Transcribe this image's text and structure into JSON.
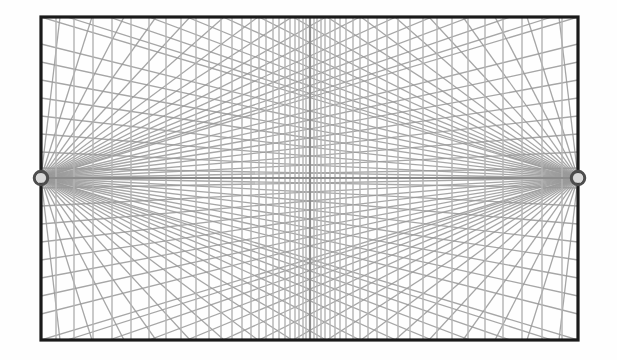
{
  "canvas": {
    "width": 617,
    "height": 360,
    "background_color": "#fefefe",
    "title": "two-point-perspective-grid"
  },
  "colors": {
    "background": "#fefefe",
    "frame_stroke": "#1a1a1a",
    "grid_stroke": "#9a9a9a",
    "grid_stroke_light": "#b4b4b4",
    "horizon_stroke": "#8c8c8c",
    "center_vertical_stroke": "#8c8c8c",
    "vanishing_point_ring": "#4d4d4d",
    "vanishing_point_fill": "#d9d9d9"
  },
  "frame": {
    "name": "picture-plane-frame",
    "x": 41,
    "y": 17,
    "width": 537,
    "height": 323,
    "stroke_width": 3.2
  },
  "horizon": {
    "name": "horizon-line",
    "y": 178,
    "x_start": 41,
    "x_end": 578,
    "stroke_width": 2.2
  },
  "center_vertical": {
    "name": "center-vertical-line",
    "x": 310,
    "y_start": 17,
    "y_end": 340,
    "stroke_width": 2.2
  },
  "vanishing_points": [
    {
      "name": "left-vanishing-point",
      "label": "VP-Left",
      "cx": 41,
      "cy": 178,
      "outer_radius": 8.5,
      "inner_radius": 5.0,
      "ring_width": 3.0
    },
    {
      "name": "right-vanishing-point",
      "label": "VP-Right",
      "cx": 578,
      "cy": 178,
      "outer_radius": 8.5,
      "inner_radius": 5.0,
      "ring_width": 3.0
    }
  ],
  "verticals": {
    "name": "vertical-grid-lines",
    "stroke_width": 1.5,
    "description": "Vertical lines converging in spacing toward the centre of the picture plane",
    "x_positions": [
      56,
      74,
      93,
      112,
      131,
      149,
      166,
      181,
      196,
      209,
      221,
      232,
      242,
      251,
      259,
      266,
      273,
      279,
      285,
      290,
      295,
      299,
      303,
      306,
      314,
      317,
      321,
      325,
      330,
      335,
      340,
      346,
      353,
      360,
      368,
      377,
      387,
      398,
      410,
      423,
      437,
      452,
      468,
      485,
      503,
      522,
      542,
      562
    ]
  },
  "radiating_lines": {
    "name": "perspective-convergence-lines",
    "stroke_width": 1.3,
    "description": "Straight lines radiating from each vanishing point across the frame",
    "left_endpoints_top": [
      60,
      92,
      124,
      156,
      190,
      224,
      258,
      292,
      326,
      360,
      396,
      432,
      470,
      510,
      552,
      578
    ],
    "left_endpoints_bottom": [
      60,
      92,
      124,
      156,
      190,
      224,
      258,
      292,
      326,
      360,
      396,
      432,
      470,
      510,
      552,
      578
    ],
    "left_endpoints_right_edge": [
      44,
      62,
      80,
      98,
      116,
      134,
      152,
      168,
      188,
      206,
      224,
      242,
      260,
      278,
      296,
      314
    ],
    "right_endpoints_top": [
      559,
      527,
      495,
      463,
      429,
      395,
      361,
      327,
      293,
      259,
      223,
      187,
      149,
      109,
      67,
      41
    ],
    "right_endpoints_bottom": [
      559,
      527,
      495,
      463,
      429,
      395,
      361,
      327,
      293,
      259,
      223,
      187,
      149,
      109,
      67,
      41
    ],
    "right_endpoints_left_edge": [
      44,
      62,
      80,
      98,
      116,
      134,
      152,
      168,
      188,
      206,
      224,
      242,
      260,
      278,
      296,
      314
    ]
  },
  "chart_data": {
    "type": "diagram",
    "elements": [
      "rectangular picture plane frame",
      "horizon line through both vanishing points",
      "left vanishing point marker",
      "right vanishing point marker",
      "central vertical axis",
      "family of vertical lines",
      "two fans of convergence lines"
    ],
    "vanishing_point_count": 2,
    "vertical_line_count": 48,
    "convergence_line_count_per_point": 32
  }
}
